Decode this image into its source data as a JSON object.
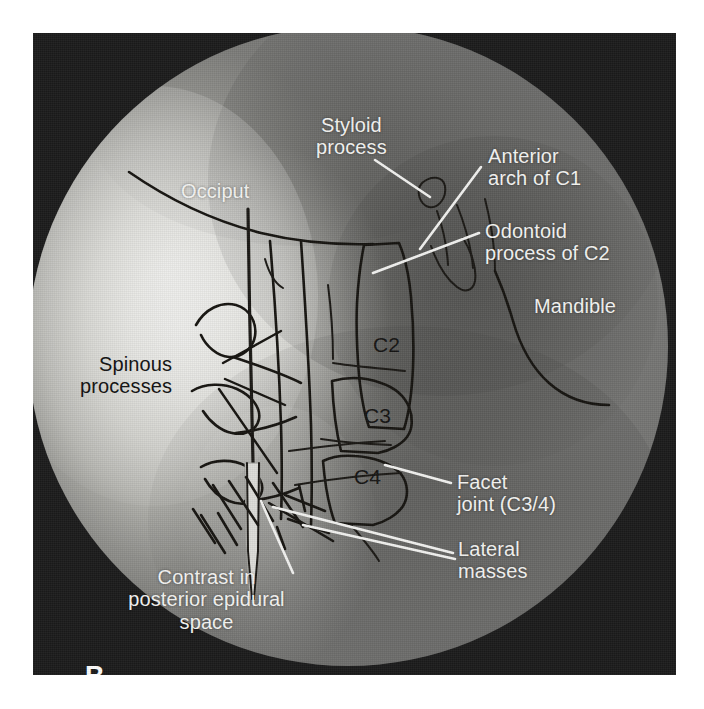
{
  "figure": {
    "panel_letter": "B",
    "modality": "fluoroscopic-radiograph",
    "region": "cervical spine lateral view"
  },
  "labels": {
    "styloid_process": "Styloid\nprocess",
    "occiput": "Occiput",
    "anterior_arch_c1": "Anterior\narch of C1",
    "odontoid_process_c2": "Odontoid\nprocess of C2",
    "mandible": "Mandible",
    "spinous_processes": "Spinous\nprocesses",
    "facet_joint": "Facet\njoint (C3/4)",
    "lateral_masses": "Lateral\nmasses",
    "contrast_epidural": "Contrast in\nposterior epidural\nspace"
  },
  "vertebrae": {
    "c2": "C2",
    "c3": "C3",
    "c4": "C4"
  },
  "colors": {
    "label_light": "#f4f4f2",
    "label_dark": "#111010",
    "ink_outline": "#15130f",
    "plate_background": "#1b1b1b",
    "page_background": "#ffffff",
    "field_bright": "#e3e3e0",
    "field_mid": "#8f8f8b"
  }
}
